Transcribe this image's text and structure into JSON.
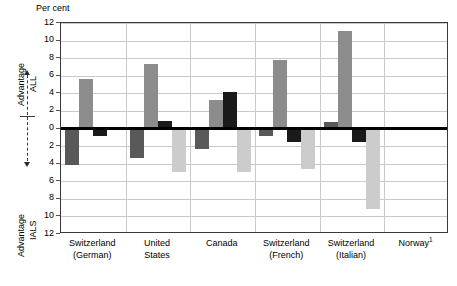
{
  "chart_data": {
    "type": "bar",
    "title": "",
    "ylabel": "Per cent",
    "xlabel": "",
    "ylim": [
      -12,
      12
    ],
    "y_ticks": [
      12,
      10,
      8,
      6,
      4,
      2,
      0,
      2,
      4,
      6,
      8,
      10,
      12
    ],
    "y_tick_values": [
      12,
      10,
      8,
      6,
      4,
      2,
      0,
      -2,
      -4,
      -6,
      -8,
      -10,
      -12
    ],
    "grid": true,
    "legend_position": "none",
    "zero_reference_line": true,
    "categories": [
      "Switzerland (German)",
      "United States",
      "Canada",
      "Switzerland (French)",
      "Switzerland (Italian)",
      "Norway"
    ],
    "series": [
      {
        "name": "series-1",
        "color": "#595959",
        "values": [
          -4.2,
          -3.3,
          -2.3,
          -0.8,
          0.7,
          null
        ]
      },
      {
        "name": "series-2",
        "color": "#8c8c8c",
        "values": [
          5.6,
          7.3,
          3.2,
          7.8,
          11.1,
          null
        ]
      },
      {
        "name": "series-3",
        "color": "#1a1a1a",
        "values": [
          -0.9,
          0.8,
          4.1,
          -1.5,
          -1.5,
          null
        ]
      },
      {
        "name": "series-4",
        "color": "#cccccc",
        "values": [
          -0.2,
          -4.9,
          -5.0,
          -4.6,
          -9.1,
          null
        ]
      }
    ],
    "annotations": {
      "top_label_line1": "Advantage",
      "top_label_line2": "ALL",
      "bottom_label_line1": "Advantage",
      "bottom_label_line2": "IALS"
    }
  },
  "axis": {
    "y_title": "Per cent"
  },
  "categories_display": [
    {
      "line1": "Switzerland",
      "line2": "(German)",
      "footnote": ""
    },
    {
      "line1": "United",
      "line2": "States",
      "footnote": ""
    },
    {
      "line1": "Canada",
      "line2": "",
      "footnote": ""
    },
    {
      "line1": "Switzerland",
      "line2": "(French)",
      "footnote": ""
    },
    {
      "line1": "Switzerland",
      "line2": "(Italian)",
      "footnote": ""
    },
    {
      "line1": "Norway",
      "line2": "",
      "footnote": "1"
    }
  ],
  "rail": {
    "advantage_all_line1": "Advantage",
    "advantage_all_line2": "ALL",
    "advantage_ials_line1": "Advantage",
    "advantage_ials_line2": "IALS"
  },
  "colors": {
    "series_1": "#595959",
    "series_2": "#8c8c8c",
    "series_3": "#1a1a1a",
    "series_4": "#cccccc",
    "grid": "#c9c9c9",
    "axis": "#3a3a3a",
    "zero": "#000000"
  }
}
